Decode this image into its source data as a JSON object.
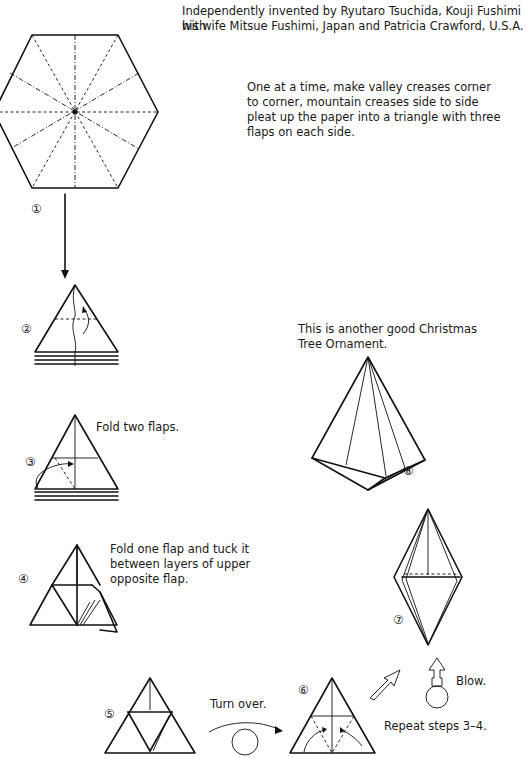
{
  "header": {
    "credit_line1": "Independently invented by Ryutaro Tsuchida, Kouji Fushimi with",
    "credit_line2": "his wife Mitsue Fushimi, Japan and Patricia Crawford, U.S.A."
  },
  "intro": {
    "line1": "One at a time, make valley creases corner",
    "line2": "to corner, mountain creases side to side",
    "line3": "pleat up the paper into a triangle with three",
    "line4": "flaps on each side."
  },
  "steps": [
    {
      "number": "①",
      "caption": ""
    },
    {
      "number": "②",
      "caption": ""
    },
    {
      "number": "③",
      "caption": "Fold two flaps."
    },
    {
      "number": "④",
      "caption_line1": "Fold one flap and tuck it",
      "caption_line2": "between layers of upper",
      "caption_line3": "opposite flap."
    },
    {
      "number": "⑤",
      "caption": ""
    },
    {
      "number": "⑥",
      "caption": "Repeat steps 3–4."
    },
    {
      "number": "⑦",
      "caption": "Blow."
    },
    {
      "number": "⑧",
      "caption_line1": "This is another good Christmas",
      "caption_line2": "Tree Ornament."
    }
  ],
  "annotations": {
    "turn_over": "Turn over.",
    "blow": "Blow.",
    "repeat": "Repeat steps 3–4."
  }
}
